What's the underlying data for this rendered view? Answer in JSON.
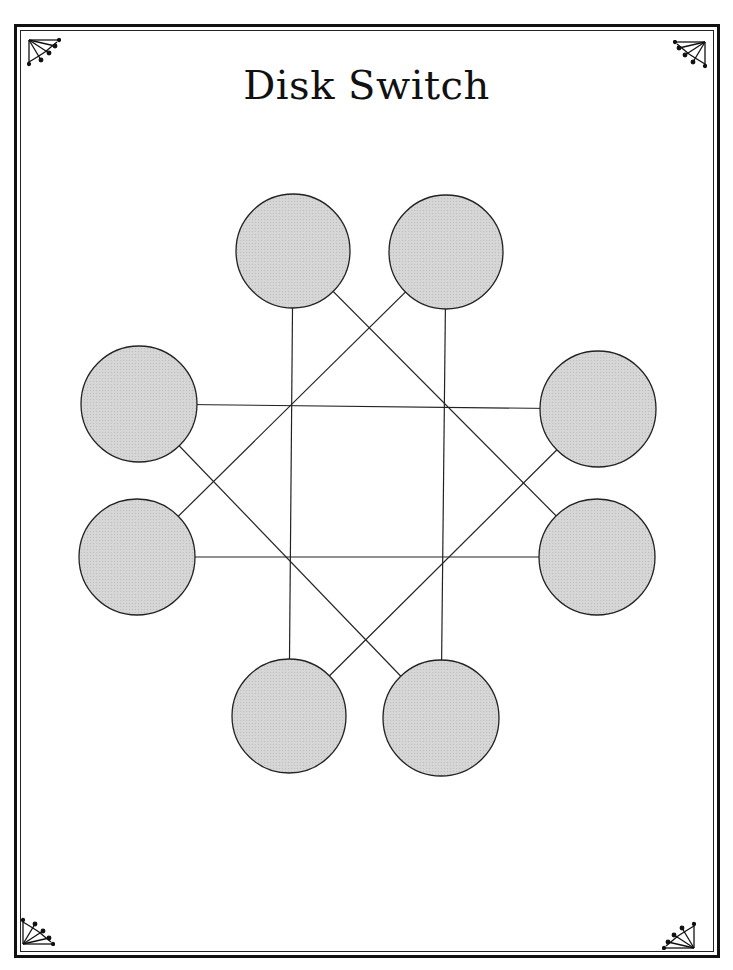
{
  "title": "Disk Switch",
  "colors": {
    "disk_fill": "#d6d6d6",
    "stroke": "#222222",
    "border": "#111111",
    "background": "#ffffff"
  },
  "disks": [
    {
      "id": "top-left",
      "cx": 293,
      "cy": 251,
      "r": 57
    },
    {
      "id": "top-right",
      "cx": 446,
      "cy": 252,
      "r": 57
    },
    {
      "id": "left-upper",
      "cx": 139,
      "cy": 404,
      "r": 58
    },
    {
      "id": "right-upper",
      "cx": 598,
      "cy": 409,
      "r": 58
    },
    {
      "id": "left-lower",
      "cx": 137,
      "cy": 557,
      "r": 58
    },
    {
      "id": "right-lower",
      "cx": 597,
      "cy": 557,
      "r": 58
    },
    {
      "id": "bottom-left",
      "cx": 289,
      "cy": 716,
      "r": 57
    },
    {
      "id": "bottom-right",
      "cx": 441,
      "cy": 718,
      "r": 58
    }
  ],
  "connections": [
    {
      "from": "top-left",
      "to": "bottom-left",
      "style": "vertical"
    },
    {
      "from": "top-right",
      "to": "bottom-right",
      "style": "vertical"
    },
    {
      "from": "left-upper",
      "to": "right-upper",
      "style": "horizontal"
    },
    {
      "from": "left-lower",
      "to": "right-lower",
      "style": "horizontal"
    },
    {
      "from": "top-left",
      "to": "right-lower",
      "style": "diagonal"
    },
    {
      "from": "top-right",
      "to": "left-lower",
      "style": "diagonal"
    },
    {
      "from": "left-upper",
      "to": "bottom-right",
      "style": "diagonal"
    },
    {
      "from": "right-upper",
      "to": "bottom-left",
      "style": "diagonal"
    }
  ],
  "corner_ornaments": [
    "top-left",
    "top-right",
    "bottom-left",
    "bottom-right"
  ]
}
